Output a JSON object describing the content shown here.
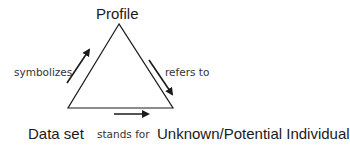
{
  "diagram": {
    "type": "semiotic-triangle",
    "nodes": {
      "top": {
        "label": "Profile"
      },
      "bottom_left": {
        "label": "Data set"
      },
      "bottom_right": {
        "label": "Unknown/Potential Individual"
      }
    },
    "edges": {
      "left": {
        "label": "symbolizes",
        "from": "Data set",
        "to": "Profile"
      },
      "right": {
        "label": "refers to",
        "from": "Profile",
        "to": "Unknown/Potential Individual"
      },
      "bottom": {
        "label": "stands for",
        "from": "Data set",
        "to": "Unknown/Potential Individual"
      }
    },
    "colors": {
      "line": "#1a1a1a",
      "text": "#1a1a1a",
      "background": "#ffffff"
    }
  }
}
